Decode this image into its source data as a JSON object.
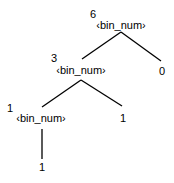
{
  "tree": {
    "root": {
      "value": "6",
      "label": "‹bin_num›"
    },
    "left": {
      "value": "3",
      "label": "‹bin_num›"
    },
    "root_right_leaf": {
      "value": "0"
    },
    "left_left": {
      "value": "1",
      "label": "‹bin_num›"
    },
    "left_right_leaf": {
      "value": "1"
    },
    "left_left_leaf": {
      "value": "1"
    }
  }
}
